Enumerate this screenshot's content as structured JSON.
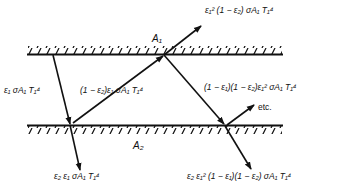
{
  "figure": {
    "surfaces": {
      "top": {
        "label": "A₁"
      },
      "bottom": {
        "label": "A₂"
      }
    },
    "rays": {
      "incident_emitted": {
        "label": "ε₁ σA₁ T₁⁴"
      },
      "absorbed_by_A2": {
        "label": "ε₂ ε₁ σA₁ T₁⁴"
      },
      "reflected_from_A2": {
        "label": "(1 − ε₂)ε₁ σA₁ T₁⁴"
      },
      "absorbed_by_A1": {
        "label": "ε₁² (1 − ε₂) σA₁ T₁⁴"
      },
      "reflected_from_A1": {
        "label": "(1 − ε₁)(1 − ε₂)ε₁² σA₁ T₁⁴"
      },
      "absorbed_by_A2_second": {
        "label": "ε₂ ε₁² (1 − ε₁)(1 − ε₂) σA₁ T₁⁴"
      },
      "continuation": {
        "label": "etc."
      }
    },
    "colors": {
      "line": "#111111",
      "background": "#ffffff"
    }
  }
}
